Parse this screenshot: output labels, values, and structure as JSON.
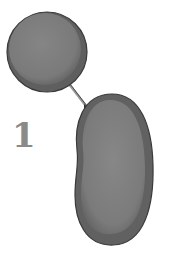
{
  "figure": {
    "step_label": "1",
    "colors": {
      "cell_fill": "#7a7a7a",
      "cell_rim": "#5e5e5e",
      "cell_outline": "#3a3a3a",
      "connector": "#555555",
      "label": "#8a8a8a",
      "background": "#ffffff"
    },
    "elements": [
      {
        "name": "small-round-cell",
        "shape": "circle"
      },
      {
        "name": "elongated-cell",
        "shape": "oblong"
      },
      {
        "name": "connector-strand",
        "shape": "line"
      }
    ]
  }
}
